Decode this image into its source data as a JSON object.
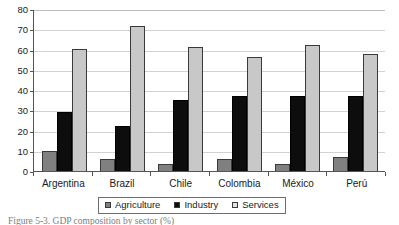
{
  "chart_data": {
    "type": "bar",
    "title": "",
    "xlabel": "",
    "ylabel": "",
    "ylim": [
      0,
      80
    ],
    "yticks": [
      0,
      10,
      20,
      30,
      40,
      50,
      60,
      70,
      80
    ],
    "ytick_labels": [
      "0",
      "10",
      "20",
      "30",
      "40",
      "50",
      "60",
      "70",
      "80"
    ],
    "grid": "horizontal",
    "legend_position": "bottom-center",
    "categories": [
      "Argentina",
      "Brazil",
      "Chile",
      "Colombia",
      "México",
      "Perú"
    ],
    "series": [
      {
        "name": "Agriculture",
        "color": "#808080",
        "values": [
          10,
          6,
          3.5,
          6,
          3.5,
          7
        ]
      },
      {
        "name": "Industry",
        "color": "#0d0d0d",
        "values": [
          29,
          22,
          35,
          37,
          37,
          37
        ]
      },
      {
        "name": "Services",
        "color": "#c8c8c8",
        "values": [
          60.5,
          71.5,
          61,
          56.5,
          62,
          58
        ]
      }
    ]
  },
  "caption": {
    "text": "Figure 5-3. GDP composition by sector (%)"
  }
}
